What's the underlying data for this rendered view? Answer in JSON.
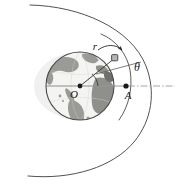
{
  "figure": {
    "type": "orbital-mechanics-diagram",
    "canvas": {
      "width": 175,
      "height": 184,
      "background": "#ffffff"
    },
    "labels": {
      "radius_vector": "r",
      "true_anomaly": "θ",
      "center": "O",
      "perigee_point": "A"
    },
    "colors": {
      "ink": "#1a1a1a",
      "orbit_stroke": "#3d3d3d",
      "axis_stroke": "#8a8a8a",
      "ocean": "#f2f2f0",
      "land": "#9a9a96",
      "land_dark": "#6f6f6b",
      "globe_edge": "#4a4a4a",
      "satellite_fill": "#b5b5b2",
      "satellite_stroke": "#3d3d3d"
    },
    "geometry": {
      "earth_center": {
        "x": 80,
        "y": 86
      },
      "earth_radius": 34,
      "satellite": {
        "x": 115,
        "y": 58
      },
      "perigee_marker": {
        "x": 126,
        "y": 86
      },
      "axis_line": {
        "x1": 80,
        "y1": 86,
        "x2": 175,
        "y2": 86
      },
      "orbit_outer_label": "outer orbital ellipse arc",
      "orbit_inner_label": "inner orbital arc through satellite"
    },
    "elements": {
      "earth_globe": "earth-globe",
      "outer_orbit": "outer-orbit-arc",
      "inner_orbit": "inner-orbit-arc",
      "radius_line": "radius-vector-line",
      "theta_line": "angle-reference-line",
      "direction_arrow": "motion-direction-arrow",
      "axis": "reference-axis"
    }
  }
}
